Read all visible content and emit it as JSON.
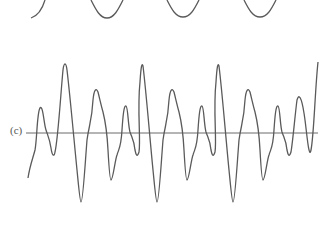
{
  "figure": {
    "panel_label": "(c)",
    "stroke_color": "#5a5a5a",
    "axis_color": "#6a6a6a",
    "top_wave": {
      "description": "partial sinusoid with troughs visible at top edge",
      "trough_x": [
        31,
        107,
        183,
        260
      ],
      "trough_y": 18
    },
    "complex_wave": {
      "description": "periodic composite waveform crossing horizontal axis",
      "axis_y": 133,
      "period_px": 76,
      "repeats": 4
    }
  }
}
